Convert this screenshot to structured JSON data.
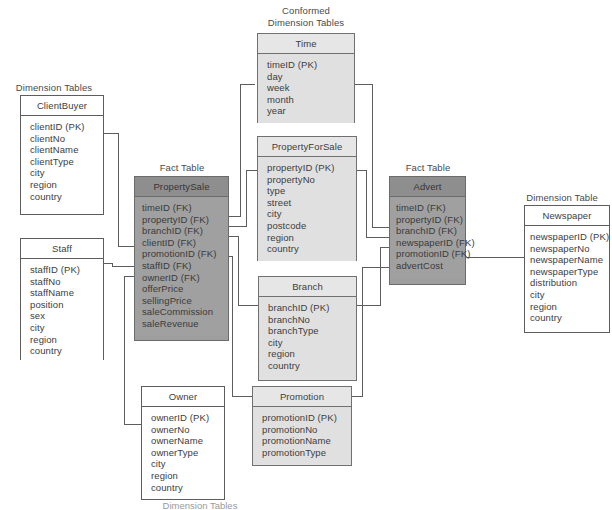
{
  "diagram": {
    "captions": {
      "dimension_tables_left": "Dimension Tables",
      "conformed_dimension_tables": "Conformed\nDimension Tables",
      "fact_table_left": "Fact Table",
      "fact_table_right": "Fact Table",
      "dimension_table_right": "Dimension Table",
      "dimension_tables_bottom": "Dimension Tables"
    },
    "colors": {
      "fact_fill": "#a0a0a0",
      "fact_header": "#8e8e8e",
      "conformed_fill": "#e0e0e0",
      "conformed_header": "#e6e6e6",
      "dimension_fill": "#ffffff",
      "border": "#5d5d5d",
      "text": "#3d3d3d",
      "connector": "#5d5d5d"
    },
    "tables": {
      "client_buyer": {
        "name": "ClientBuyer",
        "kind": "dimension",
        "fields": [
          "clientID (PK)",
          "clientNo",
          "clientName",
          "clientType",
          "city",
          "region",
          "country"
        ]
      },
      "staff": {
        "name": "Staff",
        "kind": "dimension",
        "fields": [
          "staffID (PK)",
          "staffNo",
          "staffName",
          "position",
          "sex",
          "city",
          "region",
          "country"
        ]
      },
      "owner": {
        "name": "Owner",
        "kind": "dimension",
        "fields": [
          "ownerID (PK)",
          "ownerNo",
          "ownerName",
          "ownerType",
          "city",
          "region",
          "country"
        ]
      },
      "time": {
        "name": "Time",
        "kind": "conformed-dimension",
        "fields": [
          "timeID (PK)",
          "day",
          "week",
          "month",
          "year"
        ]
      },
      "property_for_sale": {
        "name": "PropertyForSale",
        "kind": "conformed-dimension",
        "fields": [
          "propertyID (PK)",
          "propertyNo",
          "type",
          "street",
          "city",
          "postcode",
          "region",
          "country"
        ]
      },
      "branch": {
        "name": "Branch",
        "kind": "conformed-dimension",
        "fields": [
          "branchID (PK)",
          "branchNo",
          "branchType",
          "city",
          "region",
          "country"
        ]
      },
      "promotion": {
        "name": "Promotion",
        "kind": "conformed-dimension",
        "fields": [
          "promotionID (PK)",
          "promotionNo",
          "promotionName",
          "promotionType"
        ]
      },
      "newspaper": {
        "name": "Newspaper",
        "kind": "dimension",
        "fields": [
          "newspaperID (PK)",
          "newspaperNo",
          "newspaperName",
          "newspaperType",
          "distribution",
          "city",
          "region",
          "country"
        ]
      },
      "property_sale": {
        "name": "PropertySale",
        "kind": "fact",
        "fields": [
          "timeID (FK)",
          "propertyID (FK)",
          "branchID (FK)",
          "clientID (FK)",
          "promotionID (FK)",
          "staffID (FK)",
          "ownerID (FK)",
          "offerPrice",
          "sellingPrice",
          "saleCommission",
          "saleRevenue"
        ]
      },
      "advert": {
        "name": "Advert",
        "kind": "fact",
        "fields": [
          "timeID (FK)",
          "propertyID (FK)",
          "branchID (FK)",
          "newspaperID (FK)",
          "promotionID (FK)",
          "advertCost"
        ]
      }
    },
    "relationships": [
      {
        "from": "time",
        "to": "property_sale",
        "on": "timeID"
      },
      {
        "from": "property_for_sale",
        "to": "property_sale",
        "on": "propertyID"
      },
      {
        "from": "branch",
        "to": "property_sale",
        "on": "branchID"
      },
      {
        "from": "client_buyer",
        "to": "property_sale",
        "on": "clientID"
      },
      {
        "from": "promotion",
        "to": "property_sale",
        "on": "promotionID"
      },
      {
        "from": "staff",
        "to": "property_sale",
        "on": "staffID"
      },
      {
        "from": "owner",
        "to": "property_sale",
        "on": "ownerID"
      },
      {
        "from": "time",
        "to": "advert",
        "on": "timeID"
      },
      {
        "from": "property_for_sale",
        "to": "advert",
        "on": "propertyID"
      },
      {
        "from": "branch",
        "to": "advert",
        "on": "branchID"
      },
      {
        "from": "newspaper",
        "to": "advert",
        "on": "newspaperID"
      },
      {
        "from": "promotion",
        "to": "advert",
        "on": "promotionID"
      }
    ]
  }
}
